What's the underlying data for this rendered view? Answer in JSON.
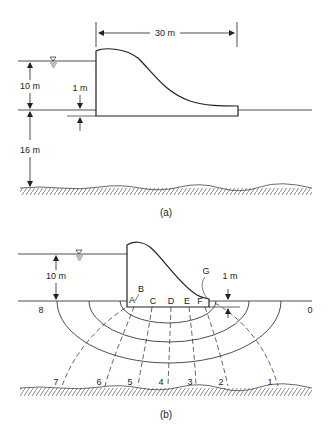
{
  "figure_a": {
    "caption": "(a)",
    "dims": {
      "length": "30 m",
      "water_depth": "10 m",
      "embedment": "1 m",
      "soil_depth": "16 m"
    },
    "water_symbol": "water-level-symbol"
  },
  "figure_b": {
    "caption": "(b)",
    "dims": {
      "water_depth": "10 m",
      "embedment": "1 m"
    },
    "points": [
      "A",
      "B",
      "C",
      "D",
      "E",
      "F",
      "G"
    ],
    "equipotential_labels": [
      "8",
      "7",
      "6",
      "5",
      "4",
      "3",
      "2",
      "1",
      "0"
    ],
    "water_symbol": "water-level-symbol"
  },
  "colors": {
    "line": "#222222",
    "background": "#ffffff"
  }
}
